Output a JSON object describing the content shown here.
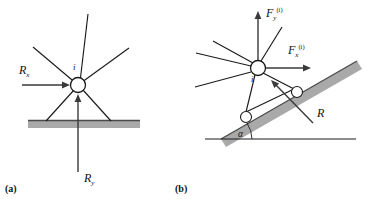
{
  "figure": {
    "background_color": "#ffffff",
    "line_color": "#1b1b1b",
    "ground_color": "#a9a9a9",
    "panels": [
      {
        "key": "a",
        "label": "(a)",
        "caption_position": {
          "x": 6,
          "y": 192
        },
        "description": "Truss node i supported on a horizontal rigid ground with reaction components",
        "node": {
          "label": "i",
          "cx": 78,
          "cy": 85,
          "r": 7.5
        },
        "labels": [
          {
            "name": "reaction-x",
            "base": "R",
            "sub": "x",
            "x": 20,
            "y": 72
          },
          {
            "name": "reaction-y",
            "base": "R",
            "sub": "y",
            "x": 86,
            "y": 182
          },
          {
            "name": "node-index",
            "base": "i",
            "x": 74,
            "y": 68
          }
        ],
        "forces": [
          {
            "name": "reaction-x-arrow",
            "from": [
              22,
              85
            ],
            "to": [
              69,
              85
            ]
          },
          {
            "name": "reaction-y-arrow",
            "from": [
              78,
              172
            ],
            "to": [
              78,
              95
            ]
          }
        ],
        "members": [
          {
            "name": "member-upper-left",
            "from": [
              78,
              85
            ],
            "to": [
              33,
              47
            ]
          },
          {
            "name": "member-upper-mid",
            "from": [
              78,
              85
            ],
            "to": [
              87,
              15
            ]
          },
          {
            "name": "member-upper-right",
            "from": [
              78,
              85
            ],
            "to": [
              128,
              48
            ]
          },
          {
            "name": "member-leg-left",
            "from": [
              78,
              85
            ],
            "to": [
              46,
              122
            ]
          },
          {
            "name": "member-leg-right",
            "from": [
              78,
              85
            ],
            "to": [
              110,
              122
            ]
          }
        ],
        "ground": {
          "x": 28,
          "y": 120,
          "width": 112,
          "height": 7
        }
      },
      {
        "key": "b",
        "label": "(b)",
        "caption_position": {
          "x": 176,
          "y": 192
        },
        "description": "Same node i supported on an inclined plane at angle alpha with rollers and normal reaction R",
        "node": {
          "label": "i",
          "cx": 258,
          "cy": 68,
          "r": 7.5
        },
        "labels": [
          {
            "name": "force-x-inclined",
            "base": "F",
            "sub": "x",
            "sup": "(i)",
            "x": 292,
            "y": 53
          },
          {
            "name": "force-y-inclined",
            "base": "F",
            "sub": "y",
            "sup": "(i)",
            "x": 253,
            "y": 16
          },
          {
            "name": "normal-reaction",
            "base": "R",
            "x": 318,
            "y": 113
          },
          {
            "name": "incline-angle",
            "base": "α",
            "x": 240,
            "y": 137
          },
          {
            "name": "node-index",
            "base": "i",
            "x": 253,
            "y": 80
          }
        ],
        "forces": [
          {
            "name": "force-x-arrow",
            "from": [
              258,
              68
            ],
            "to": [
              310,
              68
            ]
          },
          {
            "name": "force-y-arrow",
            "from": [
              258,
              68
            ],
            "to": [
              258,
              11
            ]
          },
          {
            "name": "normal-reaction-arrow",
            "from": [
              312,
              122
            ],
            "to": [
              271,
              80
            ]
          }
        ],
        "members": [
          {
            "name": "member-upper-left",
            "from": [
              258,
              68
            ],
            "to": [
              214,
              42
            ]
          },
          {
            "name": "member-upper-mid",
            "from": [
              258,
              68
            ],
            "to": [
              280,
              28
            ]
          },
          {
            "name": "member-mid-left",
            "from": [
              258,
              68
            ],
            "to": [
              197,
              54
            ]
          },
          {
            "name": "member-lower-left",
            "from": [
              258,
              68
            ],
            "to": [
              196,
              86
            ]
          },
          {
            "name": "member-bracket-left",
            "from": [
              258,
              68
            ],
            "to": [
              248,
              115
            ]
          },
          {
            "name": "member-bracket-right",
            "from": [
              258,
              68
            ],
            "to": [
              296,
              89
            ]
          }
        ],
        "rollers": [
          {
            "name": "roller-lower",
            "cx": 246,
            "cy": 117,
            "r": 5.5
          },
          {
            "name": "roller-upper",
            "cx": 297,
            "cy": 92,
            "r": 5.5
          }
        ],
        "incline": {
          "name": "inclined-plane",
          "angle_label": "α",
          "from": [
            222,
            139
          ],
          "to": [
            357,
            62
          ],
          "thickness": 8
        },
        "baseline": {
          "from": [
            207,
            139
          ],
          "to": [
            355,
            139
          ]
        },
        "angle_arc": {
          "cx": 222,
          "cy": 139,
          "r": 22,
          "start_deg": 0,
          "end_deg": 30
        }
      }
    ]
  }
}
